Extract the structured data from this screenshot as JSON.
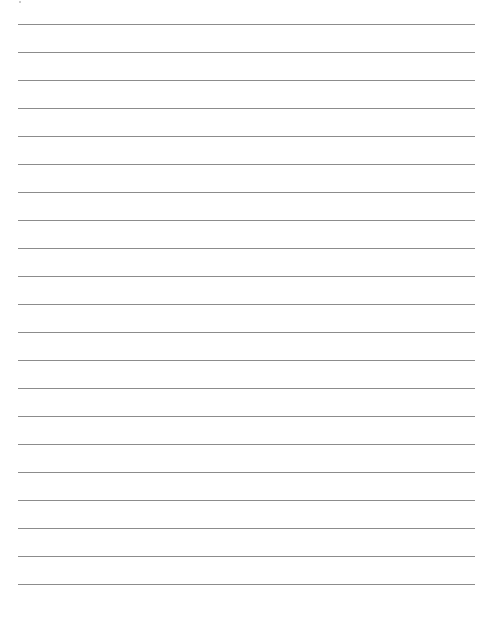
{
  "document": {
    "type": "lined-paper",
    "background_color": "#ffffff",
    "line_color": "#8c8c8c",
    "line_count": 21,
    "first_line_y": 24,
    "line_spacing": 28,
    "line_left": 18,
    "line_width": 457
  }
}
